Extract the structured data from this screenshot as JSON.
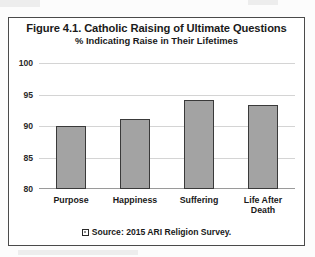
{
  "chart_data": {
    "type": "bar",
    "title": "Figure 4.1. Catholic Raising of Ultimate Questions",
    "subtitle": "% Indicating Raise in Their Lifetimes",
    "categories": [
      "Purpose",
      "Happiness",
      "Suffering",
      "Life After Death"
    ],
    "values": [
      90.0,
      91.1,
      94.2,
      93.4
    ],
    "series": [
      {
        "name": "Source: 2015 ARI Religion Survey.",
        "values": [
          90.0,
          91.1,
          94.2,
          93.4
        ]
      }
    ],
    "xlabel": "",
    "ylabel": "",
    "ylim": [
      80,
      100
    ],
    "yticks": [
      80,
      85,
      90,
      95,
      100
    ],
    "ytick_labels": [
      "80",
      "85",
      "90",
      "95",
      "100"
    ],
    "grid": true,
    "legend": {
      "position": "bottom",
      "entries": [
        "Source: 2015 ARI Religion Survey."
      ]
    },
    "colors": {
      "bar_fill": "#a3a3a3",
      "bar_border": "#3a3a3a",
      "gridline": "#d4d4d4",
      "frame": "#4a4a4a",
      "text": "#1a1a1a",
      "background": "#ffffff"
    }
  },
  "category_label_lines": [
    [
      "Purpose"
    ],
    [
      "Happiness"
    ],
    [
      "Suffering"
    ],
    [
      "Life After",
      "Death"
    ]
  ]
}
